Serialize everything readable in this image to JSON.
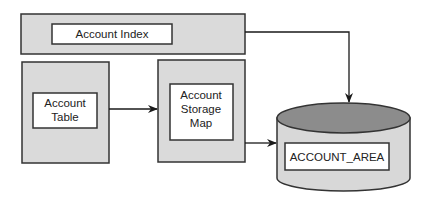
{
  "diagram": {
    "colors": {
      "outer_box_fill": "#dadada",
      "inner_box_fill": "#ffffff",
      "stroke": "#333333",
      "cylinder_top_fill": "#8c8c8c",
      "cylinder_body_fill": "#d8d8d8"
    },
    "nodes": {
      "account_index": {
        "label": "Account Index"
      },
      "account_table": {
        "label_lines": [
          "Account",
          "Table"
        ]
      },
      "account_storage_map": {
        "label_lines": [
          "Account",
          "Storage",
          "Map"
        ]
      },
      "account_area": {
        "label": "ACCOUNT_AREA",
        "shape": "cylinder"
      }
    },
    "edges": [
      {
        "from": "account_index",
        "to": "account_area"
      },
      {
        "from": "account_table",
        "to": "account_storage_map"
      },
      {
        "from": "account_storage_map",
        "to": "account_area"
      }
    ]
  }
}
